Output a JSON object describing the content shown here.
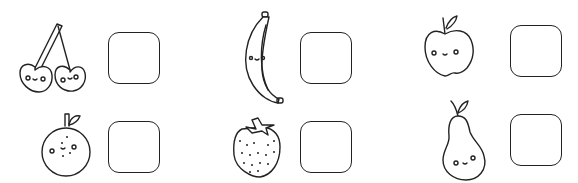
{
  "worksheet": {
    "items": [
      {
        "id": "cherry",
        "fruit": "cherry",
        "answer": ""
      },
      {
        "id": "orange",
        "fruit": "orange",
        "answer": ""
      },
      {
        "id": "banana",
        "fruit": "banana",
        "answer": ""
      },
      {
        "id": "strawberry",
        "fruit": "strawberry",
        "answer": ""
      },
      {
        "id": "apple",
        "fruit": "apple",
        "answer": ""
      },
      {
        "id": "pear",
        "fruit": "pear",
        "answer": ""
      }
    ],
    "colors": {
      "line": "#222222",
      "background": "#ffffff"
    }
  }
}
